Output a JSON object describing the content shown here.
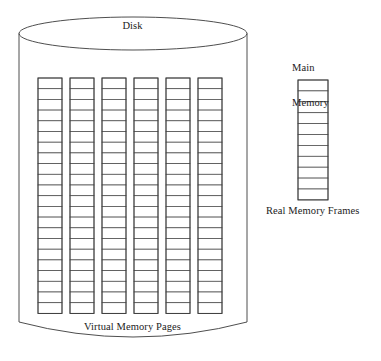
{
  "figure": {
    "type": "diagram",
    "background_color": "#ffffff",
    "stroke_color": "#3a3a3a",
    "text_color": "#222222"
  },
  "labels": {
    "disk": "Disk",
    "virtual_memory_pages": "Virtual Memory Pages",
    "main_memory_line1": "Main",
    "main_memory_line2": "Memory",
    "real_memory_frames": "Real Memory Frames"
  },
  "disk": {
    "shape": "cylinder",
    "columns_count": 6,
    "rows_per_column": 22,
    "geometry": {
      "left": 19,
      "right": 247,
      "top": 17,
      "ellipse_bottom": 50,
      "body_bottom": 322,
      "bottom_arc_depth": 20
    },
    "grid": {
      "first_column_x": 38,
      "column_width": 24,
      "column_gap": 8,
      "top_y": 78,
      "cell_height": 10.7
    }
  },
  "main_memory": {
    "shape": "column",
    "frames_count": 11,
    "geometry": {
      "left": 298,
      "width": 30,
      "top": 80,
      "cell_height": 10.9
    }
  }
}
